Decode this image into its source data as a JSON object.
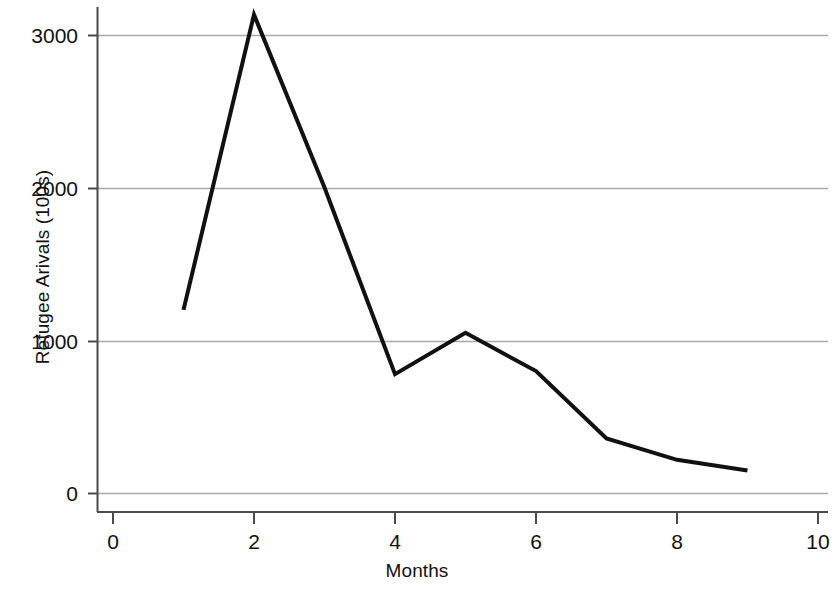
{
  "chart_data": {
    "type": "line",
    "title": "",
    "subtitle": "",
    "xlabel": "Months",
    "ylabel": "Refugee Arivals (100s)",
    "xlim": [
      0,
      10
    ],
    "ylim": [
      0,
      3300
    ],
    "xticks": [
      0,
      2,
      4,
      6,
      8,
      10
    ],
    "xtick_labels": [
      "0",
      "2",
      "4",
      "6",
      "8",
      "10"
    ],
    "yticks": [
      0,
      1000,
      2000,
      3000
    ],
    "ytick_labels": [
      "0",
      "1000",
      "2000",
      "3000"
    ],
    "grid": "horizontal",
    "grid_color": "#a9a9a9",
    "legend": null,
    "line_color": "#111111",
    "line_width": 4,
    "x": [
      1,
      2,
      3,
      4,
      5,
      6,
      7,
      8,
      9
    ],
    "values": [
      1200,
      3130,
      2000,
      780,
      1050,
      800,
      360,
      220,
      150
    ],
    "series": [
      {
        "name": "Refugee Arrivals",
        "x": [
          1,
          2,
          3,
          4,
          5,
          6,
          7,
          8,
          9
        ],
        "values": [
          1200,
          3130,
          2000,
          780,
          1050,
          800,
          360,
          220,
          150
        ]
      }
    ],
    "annotations": []
  },
  "axes": {
    "y_title": "Refugee Arivals (100s)",
    "x_title": "Months",
    "y_tick_0": "0",
    "y_tick_1": "1000",
    "y_tick_2": "2000",
    "y_tick_3": "3000",
    "x_tick_0": "0",
    "x_tick_1": "2",
    "x_tick_2": "4",
    "x_tick_3": "6",
    "x_tick_4": "8",
    "x_tick_5": "10"
  }
}
